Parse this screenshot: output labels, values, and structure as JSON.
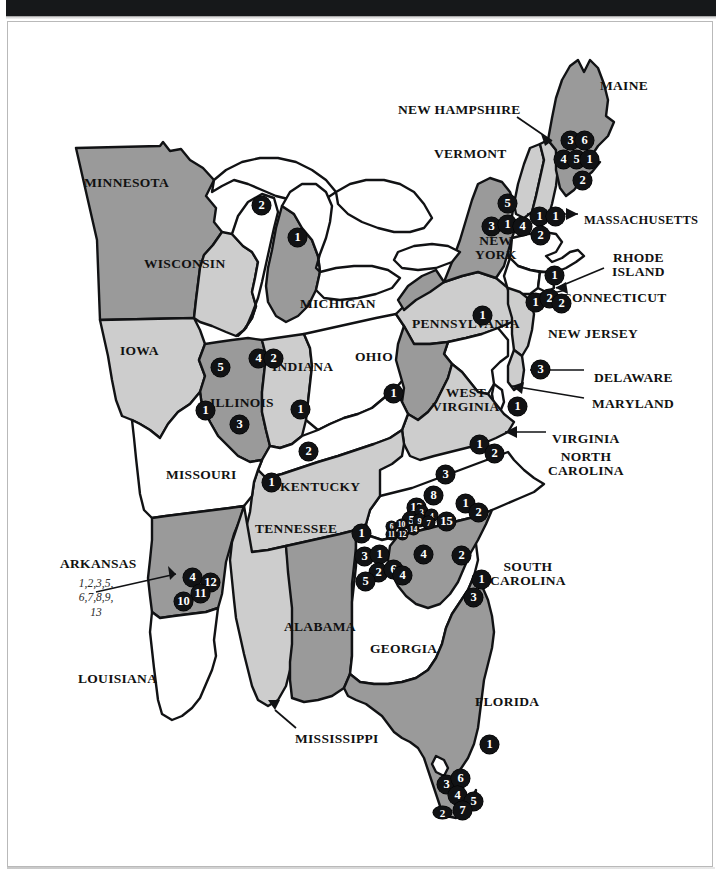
{
  "page": {
    "background_color": "#ffffff",
    "frame_border_color": "#b9b9b9",
    "top_bar_color": "#16181a"
  },
  "palette": {
    "state_dark_gray": "#9a9a9a",
    "state_light_gray": "#cdcdcd",
    "state_white": "#ffffff",
    "outline": "#111214",
    "marker_fill": "#111214",
    "marker_text": "#ffffff",
    "label_text": "#111111",
    "callout_text": "#2b2b2b"
  },
  "state_labels": [
    {
      "name": "minnesota",
      "text": "MINNESOTA",
      "x": 84,
      "y": 176,
      "size": "sz13"
    },
    {
      "name": "wisconsin",
      "text": "WISCONSIN",
      "x": 144,
      "y": 257,
      "size": "sz13"
    },
    {
      "name": "michigan",
      "text": "MICHIGAN",
      "x": 300,
      "y": 297,
      "size": "sz13"
    },
    {
      "name": "iowa",
      "text": "IOWA",
      "x": 120,
      "y": 344,
      "size": "sz13"
    },
    {
      "name": "illinois",
      "text": "ILLINOIS",
      "x": 210,
      "y": 396,
      "size": "sz13"
    },
    {
      "name": "indiana",
      "text": "INDIANA",
      "x": 272,
      "y": 360,
      "size": "sz13"
    },
    {
      "name": "ohio",
      "text": "OHIO",
      "x": 355,
      "y": 350,
      "size": "sz13"
    },
    {
      "name": "kentucky",
      "text": "KENTUCKY",
      "x": 280,
      "y": 480,
      "size": "sz13"
    },
    {
      "name": "missouri",
      "text": "MISSOURI",
      "x": 166,
      "y": 468,
      "size": "sz13"
    },
    {
      "name": "arkansas",
      "text": "ARKANSAS",
      "x": 60,
      "y": 557,
      "size": "sz13"
    },
    {
      "name": "louisiana",
      "text": "LOUISIANA",
      "x": 78,
      "y": 672,
      "size": "sz13"
    },
    {
      "name": "mississippi",
      "text": "MISSISSIPPI",
      "x": 295,
      "y": 732,
      "size": "sz13"
    },
    {
      "name": "alabama",
      "text": "ALABAMA",
      "x": 284,
      "y": 620,
      "size": "sz13"
    },
    {
      "name": "tennessee",
      "text": "TENNESSEE",
      "x": 255,
      "y": 522,
      "size": "sz13"
    },
    {
      "name": "georgia",
      "text": "GEORGIA",
      "x": 370,
      "y": 642,
      "size": "sz13"
    },
    {
      "name": "florida",
      "text": "FLORIDA",
      "x": 475,
      "y": 695,
      "size": "sz13"
    },
    {
      "name": "south-carolina",
      "text": "SOUTH\nCAROLINA",
      "x": 490,
      "y": 560,
      "size": "sz13"
    },
    {
      "name": "north-carolina",
      "text": "NORTH\nCAROLINA",
      "x": 548,
      "y": 450,
      "size": "sz13"
    },
    {
      "name": "virginia",
      "text": "VIRGINIA",
      "x": 552,
      "y": 432,
      "size": "sz13"
    },
    {
      "name": "west-virginia",
      "text": "WEST\nVIRGINIA",
      "x": 432,
      "y": 386,
      "size": "sz13"
    },
    {
      "name": "maryland",
      "text": "MARYLAND",
      "x": 592,
      "y": 397,
      "size": "sz13"
    },
    {
      "name": "delaware",
      "text": "DELAWARE",
      "x": 594,
      "y": 371,
      "size": "sz13"
    },
    {
      "name": "new-jersey",
      "text": "NEW JERSEY",
      "x": 548,
      "y": 327,
      "size": "sz13"
    },
    {
      "name": "connecticut",
      "text": "CONNECTICUT",
      "x": 562,
      "y": 291,
      "size": "sz13"
    },
    {
      "name": "rhode-island",
      "text": "RHODE\nISLAND",
      "x": 612,
      "y": 251,
      "size": "sz13"
    },
    {
      "name": "massachusetts",
      "text": "MASSACHUSETTS",
      "x": 584,
      "y": 214,
      "size": "sz12"
    },
    {
      "name": "pennsylvania",
      "text": "PENNSYLVANIA",
      "x": 412,
      "y": 317,
      "size": "sz13"
    },
    {
      "name": "new-york",
      "text": "NEW\nYORK",
      "x": 475,
      "y": 234,
      "size": "sz13"
    },
    {
      "name": "vermont",
      "text": "VERMONT",
      "x": 434,
      "y": 147,
      "size": "sz13"
    },
    {
      "name": "new-hampshire",
      "text": "NEW HAMPSHIRE",
      "x": 398,
      "y": 103,
      "size": "sz13"
    },
    {
      "name": "maine",
      "text": "MAINE",
      "x": 600,
      "y": 79,
      "size": "sz13"
    }
  ],
  "callouts": [
    {
      "name": "arkansas-cluster-callout",
      "lines": [
        "1,2,3,5,",
        "6,7,8,9,",
        "13"
      ],
      "x": 57,
      "y": 576,
      "width": 78
    }
  ],
  "markers": [
    {
      "name": "marker-wisconsin-2",
      "label": "2",
      "x": 252,
      "y": 196,
      "size": "m"
    },
    {
      "name": "marker-michigan-1",
      "label": "1",
      "x": 288,
      "y": 228,
      "size": "m"
    },
    {
      "name": "marker-illinois-5",
      "label": "5",
      "x": 211,
      "y": 358,
      "size": "m"
    },
    {
      "name": "marker-illinois-1",
      "label": "1",
      "x": 196,
      "y": 401,
      "size": "m"
    },
    {
      "name": "marker-illinois-3",
      "label": "3",
      "x": 230,
      "y": 415,
      "size": "m"
    },
    {
      "name": "marker-illinois-4",
      "label": "4",
      "x": 249,
      "y": 349,
      "size": "m"
    },
    {
      "name": "marker-indiana-2",
      "label": "2",
      "x": 264,
      "y": 349,
      "size": "m"
    },
    {
      "name": "marker-indiana-1",
      "label": "1",
      "x": 291,
      "y": 400,
      "size": "m"
    },
    {
      "name": "marker-indiana-2b",
      "label": "2",
      "x": 299,
      "y": 442,
      "size": "m"
    },
    {
      "name": "marker-kentucky-1",
      "label": "1",
      "x": 262,
      "y": 473,
      "size": "m"
    },
    {
      "name": "marker-ohio-1",
      "label": "1",
      "x": 384,
      "y": 384,
      "size": "m"
    },
    {
      "name": "marker-pennsylvania-1",
      "label": "1",
      "x": 473,
      "y": 306,
      "size": "m"
    },
    {
      "name": "marker-newyork-5",
      "label": "5",
      "x": 498,
      "y": 194,
      "size": "m"
    },
    {
      "name": "marker-newyork-3",
      "label": "3",
      "x": 482,
      "y": 217,
      "size": "m"
    },
    {
      "name": "marker-newyork-1",
      "label": "1",
      "x": 498,
      "y": 215,
      "size": "m"
    },
    {
      "name": "marker-newyork-4",
      "label": "4",
      "x": 513,
      "y": 217,
      "size": "m"
    },
    {
      "name": "marker-vermont-1",
      "label": "1",
      "x": 530,
      "y": 207,
      "size": "m"
    },
    {
      "name": "marker-vermont-2",
      "label": "2",
      "x": 531,
      "y": 226,
      "size": "m"
    },
    {
      "name": "marker-newhampshire-1",
      "label": "1",
      "x": 546,
      "y": 207,
      "size": "m"
    },
    {
      "name": "marker-maine-3",
      "label": "3",
      "x": 561,
      "y": 131,
      "size": "m"
    },
    {
      "name": "marker-maine-6",
      "label": "6",
      "x": 575,
      "y": 131,
      "size": "m"
    },
    {
      "name": "marker-maine-4",
      "label": "4",
      "x": 554,
      "y": 150,
      "size": "m"
    },
    {
      "name": "marker-maine-5",
      "label": "5",
      "x": 567,
      "y": 150,
      "size": "m"
    },
    {
      "name": "marker-maine-1",
      "label": "1",
      "x": 580,
      "y": 150,
      "size": "m"
    },
    {
      "name": "marker-maine-2",
      "label": "2",
      "x": 573,
      "y": 171,
      "size": "m"
    },
    {
      "name": "marker-massachusetts-1",
      "label": "1",
      "x": 545,
      "y": 266,
      "size": "m"
    },
    {
      "name": "marker-connecticut-1",
      "label": "1",
      "x": 526,
      "y": 293,
      "size": "m"
    },
    {
      "name": "marker-connecticut-2",
      "label": "2",
      "x": 540,
      "y": 289,
      "size": "m"
    },
    {
      "name": "marker-rhodeisland-2",
      "label": "2",
      "x": 552,
      "y": 294,
      "size": "m"
    },
    {
      "name": "marker-newjersey-3",
      "label": "3",
      "x": 531,
      "y": 360,
      "size": "m"
    },
    {
      "name": "marker-maryland-1",
      "label": "1",
      "x": 508,
      "y": 397,
      "size": "m"
    },
    {
      "name": "marker-virginia-1",
      "label": "1",
      "x": 470,
      "y": 435,
      "size": "m"
    },
    {
      "name": "marker-virginia-2",
      "label": "2",
      "x": 485,
      "y": 444,
      "size": "m"
    },
    {
      "name": "marker-westvirginia-3",
      "label": "3",
      "x": 436,
      "y": 465,
      "size": "m"
    },
    {
      "name": "marker-nc-8",
      "label": "8",
      "x": 424,
      "y": 486,
      "size": "m"
    },
    {
      "name": "marker-nc-13",
      "label": "13",
      "x": 407,
      "y": 498,
      "size": "m"
    },
    {
      "name": "marker-nc-5",
      "label": "5",
      "x": 402,
      "y": 511,
      "size": "m"
    },
    {
      "name": "marker-nc-3sm",
      "label": "3",
      "x": 415,
      "y": 505,
      "size": "t"
    },
    {
      "name": "marker-nc-4sm",
      "label": "4",
      "x": 425,
      "y": 509,
      "size": "t"
    },
    {
      "name": "marker-nc-9sm",
      "label": "9",
      "x": 413,
      "y": 514,
      "size": "t"
    },
    {
      "name": "marker-nc-7sm",
      "label": "7",
      "x": 422,
      "y": 516,
      "size": "t"
    },
    {
      "name": "marker-nc-6sm",
      "label": "6",
      "x": 386,
      "y": 521,
      "size": "tt"
    },
    {
      "name": "marker-nc-10sm",
      "label": "10",
      "x": 396,
      "y": 519,
      "size": "tt"
    },
    {
      "name": "marker-nc-14sm",
      "label": "14",
      "x": 408,
      "y": 524,
      "size": "tt"
    },
    {
      "name": "marker-nc-11sm",
      "label": "11",
      "x": 386,
      "y": 529,
      "size": "tt"
    },
    {
      "name": "marker-nc-12sm",
      "label": "12",
      "x": 397,
      "y": 529,
      "size": "tt"
    },
    {
      "name": "marker-nc-15",
      "label": "15",
      "x": 437,
      "y": 512,
      "size": "m"
    },
    {
      "name": "marker-nc-1",
      "label": "1",
      "x": 456,
      "y": 494,
      "size": "m"
    },
    {
      "name": "marker-nc-2",
      "label": "2",
      "x": 469,
      "y": 503,
      "size": "m"
    },
    {
      "name": "marker-tennessee-1",
      "label": "1",
      "x": 352,
      "y": 524,
      "size": "m"
    },
    {
      "name": "marker-tennessee-3",
      "label": "3",
      "x": 355,
      "y": 547,
      "size": "m"
    },
    {
      "name": "marker-tennessee-1b",
      "label": "1",
      "x": 370,
      "y": 545,
      "size": "m"
    },
    {
      "name": "marker-tennessee-2",
      "label": "2",
      "x": 369,
      "y": 563,
      "size": "m"
    },
    {
      "name": "marker-tennessee-5",
      "label": "5",
      "x": 356,
      "y": 572,
      "size": "m"
    },
    {
      "name": "marker-georgia-6",
      "label": "6",
      "x": 384,
      "y": 560,
      "size": "m"
    },
    {
      "name": "marker-georgia-4",
      "label": "4",
      "x": 393,
      "y": 566,
      "size": "m"
    },
    {
      "name": "marker-georgia-4b",
      "label": "4",
      "x": 414,
      "y": 545,
      "size": "m"
    },
    {
      "name": "marker-georgia-2",
      "label": "2",
      "x": 452,
      "y": 546,
      "size": "m"
    },
    {
      "name": "marker-sc-1",
      "label": "1",
      "x": 472,
      "y": 570,
      "size": "m"
    },
    {
      "name": "marker-sc-3",
      "label": "3",
      "x": 464,
      "y": 588,
      "size": "m"
    },
    {
      "name": "marker-arkansas-4",
      "label": "4",
      "x": 183,
      "y": 568,
      "size": "m"
    },
    {
      "name": "marker-arkansas-12",
      "label": "12",
      "x": 201,
      "y": 573,
      "size": "m"
    },
    {
      "name": "marker-arkansas-11",
      "label": "11",
      "x": 191,
      "y": 584,
      "size": "m"
    },
    {
      "name": "marker-arkansas-10",
      "label": "10",
      "x": 174,
      "y": 592,
      "size": "m"
    },
    {
      "name": "marker-florida-1",
      "label": "1",
      "x": 480,
      "y": 735,
      "size": "m"
    },
    {
      "name": "marker-florida-3",
      "label": "3",
      "x": 437,
      "y": 775,
      "size": "m"
    },
    {
      "name": "marker-florida-6",
      "label": "6",
      "x": 451,
      "y": 769,
      "size": "m"
    },
    {
      "name": "marker-florida-4",
      "label": "4",
      "x": 448,
      "y": 786,
      "size": "m"
    },
    {
      "name": "marker-florida-5",
      "label": "5",
      "x": 464,
      "y": 792,
      "size": "m"
    },
    {
      "name": "marker-florida-7",
      "label": "7",
      "x": 453,
      "y": 801,
      "size": "m"
    },
    {
      "name": "marker-keys-2",
      "label": "2",
      "x": 433,
      "y": 806,
      "size": "flat"
    }
  ]
}
